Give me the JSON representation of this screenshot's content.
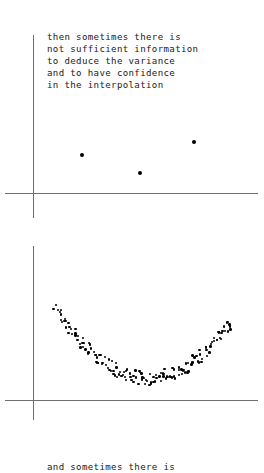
{
  "figure": {
    "background_color": "#ffffff",
    "ink_color": "#000000",
    "axis_color": "#6e6e6e"
  },
  "panels": [
    {
      "id": "sparse-data-panel",
      "caption": "then sometimes there is\nnot sufficient information\nto deduce the variance\nand to have confidence\nin the interpolation",
      "caption_lines": [
        "then sometimes there is",
        "not sufficient information",
        "to deduce the variance",
        "and to have confidence",
        "in the interpolation"
      ]
    },
    {
      "id": "dense-data-panel",
      "caption": "and sometimes there is",
      "caption_lines": [
        "and sometimes there is"
      ]
    }
  ],
  "chart_data": [
    {
      "type": "scatter",
      "title": "then sometimes there is not sufficient information to deduce the variance and to have confidence in the interpolation",
      "xlabel": "",
      "ylabel": "",
      "xlim": [
        0,
        1
      ],
      "ylim": [
        0,
        1
      ],
      "grid": false,
      "legend": "none",
      "axes": {
        "y_axis_x_px": 33,
        "y_axis_top_px": 35,
        "y_axis_bottom_px": 218,
        "x_axis_y_px": 193,
        "x_axis_left_px": 5,
        "x_axis_right_px": 258
      },
      "series": [
        {
          "name": "sparse observations",
          "marker": "dot",
          "x": [
            0.215,
            0.475,
            0.715
          ],
          "y": [
            0.245,
            0.13,
            0.33
          ],
          "points_px": [
            {
              "x": 82,
              "y": 155
            },
            {
              "x": 140,
              "y": 173
            },
            {
              "x": 194,
              "y": 142
            }
          ]
        }
      ]
    },
    {
      "type": "scatter",
      "title": "and sometimes there is",
      "xlabel": "",
      "ylabel": "",
      "xlim": [
        0,
        1
      ],
      "ylim": [
        0,
        1
      ],
      "grid": false,
      "legend": "none",
      "axes": {
        "y_axis_x_px": 33,
        "y_axis_top_px": 246,
        "y_axis_bottom_px": 420,
        "x_axis_y_px": 400,
        "x_axis_left_px": 5,
        "x_axis_right_px": 258
      },
      "series": [
        {
          "name": "dense noisy observations",
          "marker": "dot",
          "shape": "parabolic U-curve with scatter noise",
          "n_points": 160,
          "x_range_px": [
            55,
            232
          ],
          "y_range_px": [
            308,
            382
          ],
          "curve_vertex_px": {
            "x": 148,
            "y": 378
          },
          "noise_amplitude_px": 7
        }
      ]
    }
  ]
}
